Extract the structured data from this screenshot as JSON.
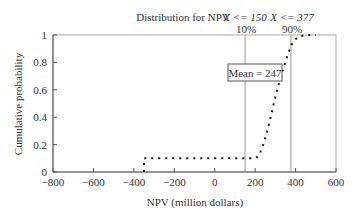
{
  "chart_data": {
    "type": "line",
    "title": "Distribution for NPV",
    "xlabel": "NPV (million dollars)",
    "ylabel": "Cumulative probability",
    "xlim": [
      -800,
      600
    ],
    "ylim": [
      0,
      1
    ],
    "xticks": [
      -800,
      -600,
      -400,
      -200,
      0,
      200,
      400,
      600
    ],
    "xtick_labels": [
      "−800",
      "−600",
      "−400",
      "−200",
      "0",
      "200",
      "400",
      "600"
    ],
    "yticks": [
      0,
      0.2,
      0.4,
      0.6,
      0.8,
      1
    ],
    "ytick_labels": [
      "0",
      "0.2",
      "0.4",
      "0.6",
      "0.8",
      "1"
    ],
    "grid": false,
    "series": [
      {
        "name": "Cumulative NPV",
        "style": "dotted",
        "x": [
          -350,
          -350,
          -300,
          -200,
          -100,
          0,
          100,
          200,
          220,
          240,
          260,
          280,
          300,
          320,
          340,
          360,
          380,
          400,
          420,
          450,
          500
        ],
        "y": [
          0,
          0.1,
          0.1,
          0.1,
          0.1,
          0.1,
          0.1,
          0.1,
          0.12,
          0.2,
          0.3,
          0.42,
          0.55,
          0.66,
          0.76,
          0.85,
          0.93,
          0.97,
          0.99,
          1.0,
          1.0
        ]
      }
    ],
    "markers": [
      {
        "x": 150,
        "label_top": "X <= 150",
        "label_bottom": "10%"
      },
      {
        "x": 377,
        "label_top": "X <= 377",
        "label_bottom": "90%"
      }
    ],
    "annotations": [
      {
        "text": "Mean = 247",
        "mean": 247
      }
    ]
  }
}
